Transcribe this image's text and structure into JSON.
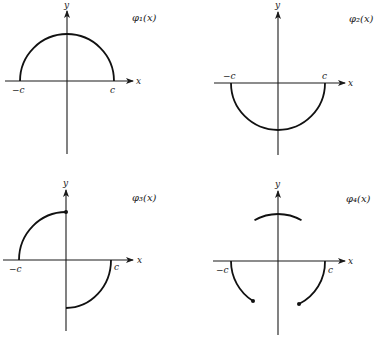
{
  "panels": [
    {
      "id": "phi1",
      "function_label": "φ₁(x)",
      "x_axis_label": "x",
      "y_axis_label": "y",
      "tick_left": "−c",
      "tick_right": "c",
      "description": "Upper semicircle from −c to c"
    },
    {
      "id": "phi2",
      "function_label": "φ₂(x)",
      "x_axis_label": "x",
      "y_axis_label": "y",
      "tick_left": "−c",
      "tick_right": "c",
      "description": "Lower semicircle from −c to c"
    },
    {
      "id": "phi3",
      "function_label": "φ₃(x)",
      "x_axis_label": "x",
      "y_axis_label": "y",
      "tick_left": "−c",
      "tick_right": "c",
      "description": "Upper quarter circle on [−c,0] with closed dot at top; lower quarter circle on [0,c]"
    },
    {
      "id": "phi4",
      "function_label": "φ₄(x)",
      "x_axis_label": "x",
      "y_axis_label": "y",
      "tick_left": "−c",
      "tick_right": "c",
      "description": "Lower arcs on outer intervals ending in dots; upper arc on middle interval"
    }
  ]
}
